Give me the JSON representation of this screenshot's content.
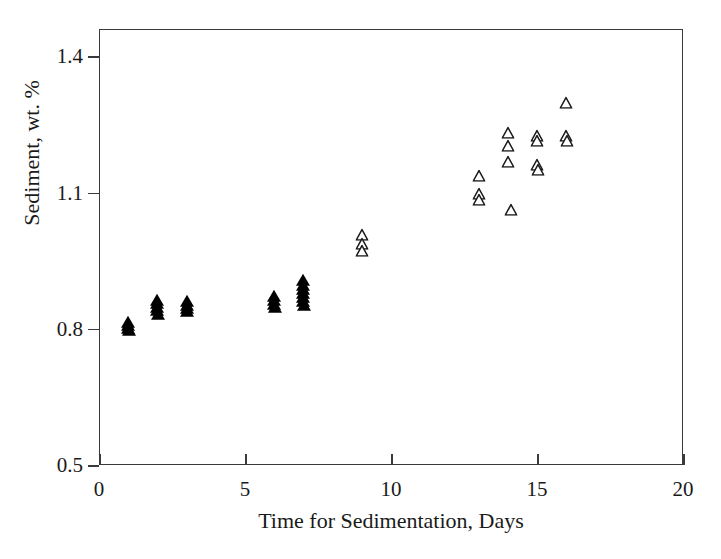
{
  "chart_data": {
    "type": "scatter",
    "title": "",
    "xlabel": "Time for Sedimentation, Days",
    "ylabel": "Sediment, wt. %",
    "xlim": [
      0,
      20
    ],
    "ylim": [
      0.5,
      1.46
    ],
    "xticks": [
      0,
      5,
      10,
      15,
      20
    ],
    "xticklabels": [
      "0",
      "5",
      "10",
      "15",
      "20"
    ],
    "yticks": [
      0.5,
      0.8,
      1.1,
      1.4
    ],
    "yticklabels": [
      "0.5",
      "0.8",
      "1.1",
      "1.4"
    ],
    "grid": false,
    "legend": null,
    "series": [
      {
        "name": "filled-triangle-series",
        "marker": "triangle-filled",
        "color": "#000000",
        "points": [
          {
            "x": 1.0,
            "y": 0.806
          },
          {
            "x": 1.0,
            "y": 0.8
          },
          {
            "x": 1.0,
            "y": 0.812
          },
          {
            "x": 1.02,
            "y": 0.795
          },
          {
            "x": 2.0,
            "y": 0.862
          },
          {
            "x": 2.0,
            "y": 0.855
          },
          {
            "x": 2.0,
            "y": 0.846
          },
          {
            "x": 2.0,
            "y": 0.838
          },
          {
            "x": 2.02,
            "y": 0.83
          },
          {
            "x": 3.0,
            "y": 0.86
          },
          {
            "x": 3.0,
            "y": 0.851
          },
          {
            "x": 3.0,
            "y": 0.843
          },
          {
            "x": 3.02,
            "y": 0.836
          },
          {
            "x": 6.0,
            "y": 0.871
          },
          {
            "x": 6.0,
            "y": 0.862
          },
          {
            "x": 6.0,
            "y": 0.853
          },
          {
            "x": 6.02,
            "y": 0.845
          },
          {
            "x": 7.0,
            "y": 0.905
          },
          {
            "x": 7.0,
            "y": 0.895
          },
          {
            "x": 7.0,
            "y": 0.886
          },
          {
            "x": 7.0,
            "y": 0.877
          },
          {
            "x": 7.0,
            "y": 0.868
          },
          {
            "x": 7.0,
            "y": 0.859
          },
          {
            "x": 7.02,
            "y": 0.85
          }
        ]
      },
      {
        "name": "open-triangle-series",
        "marker": "triangle-open",
        "color": "#1a1a1a",
        "points": [
          {
            "x": 9.0,
            "y": 1.005
          },
          {
            "x": 9.0,
            "y": 0.985
          },
          {
            "x": 9.02,
            "y": 0.968
          },
          {
            "x": 13.0,
            "y": 1.135
          },
          {
            "x": 13.0,
            "y": 1.095
          },
          {
            "x": 13.02,
            "y": 1.082
          },
          {
            "x": 14.0,
            "y": 1.228
          },
          {
            "x": 14.0,
            "y": 1.2
          },
          {
            "x": 14.0,
            "y": 1.165
          },
          {
            "x": 14.1,
            "y": 1.06
          },
          {
            "x": 15.0,
            "y": 1.222
          },
          {
            "x": 15.0,
            "y": 1.212
          },
          {
            "x": 15.0,
            "y": 1.158
          },
          {
            "x": 15.02,
            "y": 1.148
          },
          {
            "x": 16.0,
            "y": 1.295
          },
          {
            "x": 16.0,
            "y": 1.222
          },
          {
            "x": 16.02,
            "y": 1.212
          }
        ]
      }
    ]
  }
}
